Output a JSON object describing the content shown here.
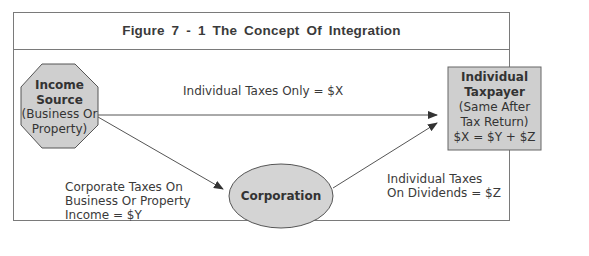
{
  "figure": {
    "title": "Figure 7 - 1    The Concept Of Integration"
  },
  "nodes": {
    "income_source": {
      "title_line1": "Income",
      "title_line2": "Source",
      "sub_line1": "(Business Or",
      "sub_line2": "Property)",
      "shape": "octagon",
      "fill": "#cfcfcf"
    },
    "corporation": {
      "title": "Corporation",
      "shape": "ellipse",
      "fill": "#d4d4d4"
    },
    "individual_taxpayer": {
      "title_line1": "Individual",
      "title_line2": "Taxpayer",
      "sub_line1": "(Same After",
      "sub_line2": "Tax Return)",
      "sub_line3": "$X = $Y + $Z",
      "shape": "rectangle",
      "fill": "#cfcfcf"
    }
  },
  "edges": {
    "direct": {
      "label": "Individual Taxes Only = $X"
    },
    "to_corporation": {
      "label_line1": "Corporate Taxes On",
      "label_line2": "Business Or Property",
      "label_line3": "Income = $Y"
    },
    "dividends": {
      "label_line1": "Individual Taxes",
      "label_line2": "On Dividends = $Z"
    }
  },
  "colors": {
    "border": "#7a7a7a",
    "shape_stroke": "#555555",
    "text": "#333333"
  }
}
